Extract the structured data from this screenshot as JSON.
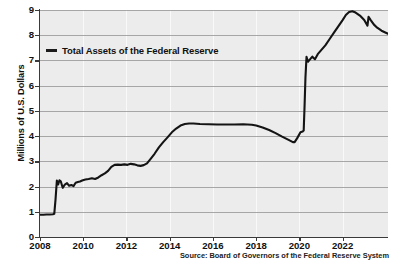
{
  "chart_data": {
    "type": "line",
    "title": "",
    "xlabel": "",
    "ylabel": "Millions of U.S. Dollars",
    "xlim": [
      2008,
      2024.1
    ],
    "ylim": [
      0,
      9
    ],
    "grid": true,
    "legend_position": "upper-left",
    "source_note": "Source: Board of Governors of the Federal Reserve System",
    "xticks": [
      "2008",
      "2010",
      "2012",
      "2014",
      "2016",
      "2018",
      "2020",
      "2022"
    ],
    "xtick_values": [
      2008,
      2010,
      2012,
      2014,
      2016,
      2018,
      2020,
      2022
    ],
    "yticks": [
      "0",
      "1",
      "2",
      "3",
      "4",
      "5",
      "6",
      "7",
      "8",
      "9"
    ],
    "ytick_values": [
      0,
      1,
      2,
      3,
      4,
      5,
      6,
      7,
      8,
      9
    ],
    "series": [
      {
        "name": "Total Assets of the Federal Reserve",
        "color": "#141414",
        "units": "Millions of U.S. Dollars",
        "x": [
          2008.0,
          2008.15,
          2008.3,
          2008.45,
          2008.6,
          2008.66,
          2008.72,
          2008.78,
          2008.84,
          2008.9,
          2008.96,
          2009.05,
          2009.15,
          2009.25,
          2009.35,
          2009.45,
          2009.55,
          2009.65,
          2009.75,
          2009.85,
          2009.95,
          2010.1,
          2010.25,
          2010.4,
          2010.55,
          2010.7,
          2010.85,
          2011.0,
          2011.15,
          2011.3,
          2011.45,
          2011.6,
          2011.75,
          2011.9,
          2012.05,
          2012.2,
          2012.35,
          2012.5,
          2012.65,
          2012.8,
          2012.95,
          2013.1,
          2013.3,
          2013.5,
          2013.7,
          2013.9,
          2014.1,
          2014.3,
          2014.5,
          2014.7,
          2014.9,
          2015.1,
          2015.4,
          2015.8,
          2016.2,
          2016.6,
          2017.0,
          2017.4,
          2017.8,
          2018.0,
          2018.3,
          2018.6,
          2018.9,
          2019.2,
          2019.5,
          2019.7,
          2019.78,
          2019.9,
          2020.05,
          2020.15,
          2020.2,
          2020.24,
          2020.28,
          2020.33,
          2020.4,
          2020.45,
          2020.5,
          2020.6,
          2020.72,
          2020.85,
          2021.0,
          2021.2,
          2021.4,
          2021.6,
          2021.8,
          2022.0,
          2022.15,
          2022.3,
          2022.45,
          2022.6,
          2022.8,
          2023.0,
          2023.15,
          2023.2,
          2023.3,
          2023.45,
          2023.6,
          2023.8,
          2024.0,
          2024.1
        ],
        "y": [
          0.88,
          0.88,
          0.89,
          0.89,
          0.9,
          0.92,
          1.5,
          2.24,
          2.08,
          2.25,
          2.21,
          1.95,
          2.08,
          2.14,
          2.03,
          2.06,
          2.02,
          2.15,
          2.18,
          2.2,
          2.24,
          2.28,
          2.3,
          2.33,
          2.3,
          2.36,
          2.45,
          2.52,
          2.62,
          2.78,
          2.86,
          2.87,
          2.86,
          2.88,
          2.86,
          2.9,
          2.88,
          2.84,
          2.82,
          2.85,
          2.92,
          3.08,
          3.3,
          3.55,
          3.76,
          3.95,
          4.15,
          4.3,
          4.42,
          4.48,
          4.5,
          4.5,
          4.48,
          4.47,
          4.46,
          4.46,
          4.46,
          4.47,
          4.45,
          4.42,
          4.34,
          4.24,
          4.12,
          3.98,
          3.85,
          3.76,
          3.76,
          3.92,
          4.15,
          4.18,
          4.22,
          5.2,
          6.3,
          7.14,
          6.95,
          7.0,
          7.05,
          7.15,
          7.05,
          7.25,
          7.4,
          7.6,
          7.85,
          8.1,
          8.35,
          8.6,
          8.8,
          8.92,
          8.95,
          8.9,
          8.78,
          8.6,
          8.38,
          8.73,
          8.6,
          8.42,
          8.3,
          8.18,
          8.1,
          8.06
        ]
      }
    ]
  },
  "legend": {
    "entry": "Total Assets of the Federal Reserve"
  },
  "axes": {
    "ylabel": "Millions of U.S. Dollars"
  },
  "footer": {
    "source": "Source: Board of Governors of the Federal Reserve System"
  }
}
